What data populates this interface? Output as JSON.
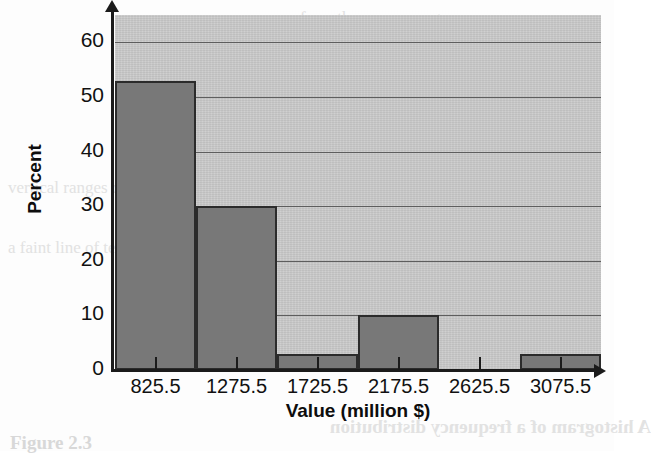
{
  "chart_data": {
    "type": "bar",
    "title": "",
    "xlabel": "Value (million $)",
    "ylabel": "Percent",
    "categories": [
      "825.5",
      "1275.5",
      "1725.5",
      "2175.5",
      "2625.5",
      "3075.5"
    ],
    "values": [
      53,
      30,
      3,
      10,
      0,
      3
    ],
    "ylim": [
      0,
      65
    ],
    "yticks": [
      "0",
      "10",
      "20",
      "30",
      "40",
      "50",
      "60"
    ],
    "ytick_values": [
      0,
      10,
      20,
      30,
      40,
      50,
      60
    ],
    "grid": "horizontal",
    "legend": "none",
    "bar_fill_color": "#787878",
    "bar_edge_color": "#2b2b2b",
    "plot_background_color": "#c9c9c9",
    "axis_color": "#1b1b1b"
  },
  "background_artifacts": {
    "bleed_1": "from the reverse page",
    "bleed_2": "vertical ranges of a",
    "bleed_3": "a faint line of text",
    "bleed_4": "A histogram of a frequency distribution",
    "bleed_5": "Figure 2.3"
  }
}
